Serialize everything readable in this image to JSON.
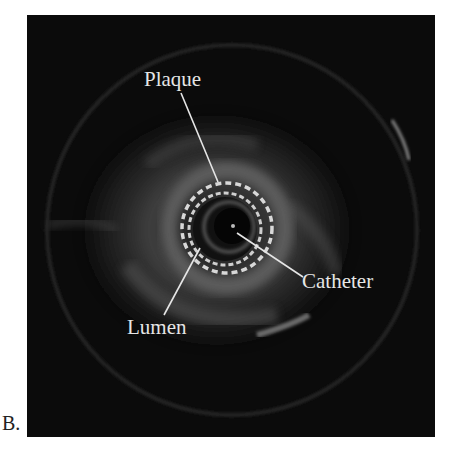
{
  "figure": {
    "panel_label": "B.",
    "image_description": "Intravascular ultrasound (IVUS) cross-sectional image",
    "annotations": [
      {
        "id": "plaque",
        "label": "Plaque"
      },
      {
        "id": "catheter",
        "label": "Catheter"
      },
      {
        "id": "lumen",
        "label": "Lumen"
      }
    ],
    "colors": {
      "background": "#0b0b0b",
      "annotation": "#e6e6e6",
      "border_dash": "#d8d8d8"
    }
  }
}
